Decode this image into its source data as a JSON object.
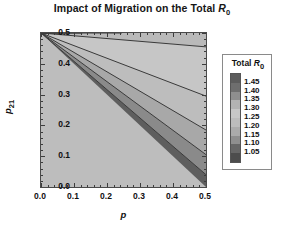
{
  "chart_data": {
    "type": "heatmap",
    "title": "Impact of Migration on the Total R0",
    "title_parts": {
      "prefix": "Impact of Migration on the Total ",
      "symbol": "R",
      "symbol_sub": "0"
    },
    "xlabel": "p",
    "ylabel": "p21",
    "ylabel_parts": {
      "symbol": "p",
      "sub": "21"
    },
    "xlim": [
      0.0,
      0.5
    ],
    "ylim": [
      0.0,
      0.5
    ],
    "xticks": [
      "0.0",
      "0.1",
      "0.2",
      "0.3",
      "0.4",
      "0.5"
    ],
    "xtick_values": [
      0.0,
      0.1,
      0.2,
      0.3,
      0.4,
      0.5
    ],
    "yticks": [
      "0.0",
      "0.1",
      "0.2",
      "0.3",
      "0.4",
      "0.5"
    ],
    "ytick_values": [
      0.0,
      0.1,
      0.2,
      0.3,
      0.4,
      0.5
    ],
    "grid": false,
    "legend_position": "right",
    "colorbar": {
      "title": "Total R0",
      "title_parts": {
        "prefix": "Total ",
        "symbol": "R",
        "symbol_sub": "0"
      },
      "labels": [
        "1.45",
        "1.40",
        "1.35",
        "1.30",
        "1.25",
        "1.20",
        "1.15",
        "1.10",
        "1.05"
      ],
      "values": [
        1.45,
        1.4,
        1.35,
        1.3,
        1.25,
        1.2,
        1.15,
        1.1,
        1.05
      ],
      "swatch_colors": [
        "#5c5c5c",
        "#6e6e6e",
        "#8e8e8e",
        "#b3b3b3",
        "#c7c7c7",
        "#bcbcbc",
        "#ababab",
        "#8f8f8f",
        "#676767",
        "#4d4d4d"
      ],
      "step": 0.05
    },
    "contour_levels": [
      1.05,
      1.1,
      1.15,
      1.2,
      1.25,
      1.3,
      1.35,
      1.4,
      1.45
    ],
    "contour_note": "All contour lines are straight rays emanating from the upper-left corner (p=0, p21=0.5).",
    "contour_rays": [
      {
        "level": 1.45,
        "end_x": 0.022,
        "end_y": 0.5,
        "fill": "#4e4e4e"
      },
      {
        "level": 1.4,
        "end_x": 0.062,
        "end_y": 0.5,
        "fill": "#606060"
      },
      {
        "level": 1.35,
        "end_x": 0.125,
        "end_y": 0.5,
        "fill": "#7b7b7b"
      },
      {
        "level": 1.3,
        "end_x": 0.245,
        "end_y": 0.5,
        "fill": "#9d9d9d"
      },
      {
        "level": 1.25,
        "end_x": 0.5,
        "end_y": 0.455,
        "fill": "#b9b9b9"
      },
      {
        "level": 1.2,
        "end_x": 0.5,
        "end_y": 0.295,
        "fill": "#c6c6c6"
      },
      {
        "level": 1.15,
        "end_x": 0.5,
        "end_y": 0.185,
        "fill": "#bdbdbd"
      },
      {
        "level": 1.1,
        "end_x": 0.5,
        "end_y": 0.105,
        "fill": "#a8a8a8"
      },
      {
        "level": 1.05,
        "end_x": 0.5,
        "end_y": 0.04,
        "fill": "#8a8a8a"
      },
      {
        "level": 1.0,
        "end_x": 0.5,
        "end_y": 0.0,
        "fill": "#5e5e5e"
      }
    ],
    "corner_values": {
      "top_left": 1.48,
      "top_right": 1.24,
      "bottom_left": 1.0,
      "bottom_right": 1.02
    },
    "line_color": "#3a3a3a"
  }
}
